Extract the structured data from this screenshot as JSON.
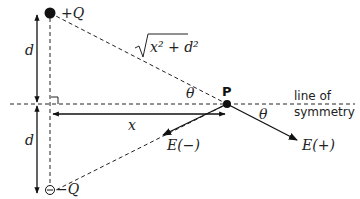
{
  "diagram": {
    "charges": {
      "positive": {
        "label": "+Q"
      },
      "negative": {
        "label": "−Q"
      }
    },
    "point": {
      "label": "P"
    },
    "distances": {
      "upper_d": "d",
      "lower_d": "d",
      "x": "x",
      "hypotenuse_radicand": "x² + d²"
    },
    "angles": {
      "theta_upper": "θ",
      "theta_lower": "θ"
    },
    "vectors": {
      "e_minus": "E(−)",
      "e_plus": "E(+)"
    },
    "axis_label": {
      "line1": "line of",
      "line2": "symmetry"
    }
  }
}
